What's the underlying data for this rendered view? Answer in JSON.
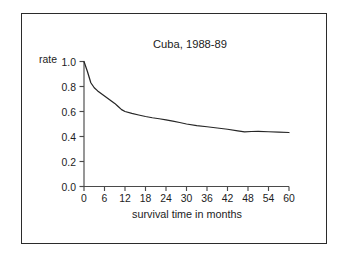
{
  "figure": {
    "background_color": "#ffffff",
    "frame_color": "#2b2b2b",
    "axis_color": "#4a4a4a",
    "curve_color": "#262626"
  },
  "chart_data": {
    "type": "line",
    "title": "Cuba, 1988-89",
    "xlabel": "survival time in months",
    "ylabel": "rate",
    "ylabel_position": "above-axis-left",
    "grid": false,
    "legend": false,
    "xlim": [
      0,
      60
    ],
    "ylim": [
      0.0,
      1.0
    ],
    "xticks": [
      0,
      6,
      12,
      18,
      24,
      30,
      36,
      42,
      48,
      54,
      60
    ],
    "xtick_labels": [
      "0",
      "6",
      "12",
      "18",
      "24",
      "30",
      "36",
      "42",
      "48",
      "54",
      "60"
    ],
    "yticks": [
      0.0,
      0.2,
      0.4,
      0.6,
      0.8,
      1.0
    ],
    "ytick_labels": [
      "0.0",
      "0.2",
      "0.4",
      "0.6",
      "0.8",
      "1.0"
    ],
    "series": [
      {
        "name": "survival rate",
        "x": [
          0,
          1,
          2,
          3,
          4,
          5,
          6,
          7,
          8,
          9,
          10,
          11,
          12,
          14,
          16,
          18,
          20,
          22,
          24,
          26,
          28,
          30,
          33,
          36,
          39,
          42,
          45,
          47,
          49,
          51,
          54,
          57,
          60
        ],
        "y": [
          1.0,
          0.92,
          0.83,
          0.79,
          0.765,
          0.745,
          0.725,
          0.705,
          0.685,
          0.665,
          0.64,
          0.615,
          0.6,
          0.585,
          0.572,
          0.56,
          0.55,
          0.542,
          0.533,
          0.523,
          0.512,
          0.5,
          0.487,
          0.478,
          0.468,
          0.458,
          0.445,
          0.437,
          0.44,
          0.441,
          0.438,
          0.435,
          0.432
        ]
      }
    ]
  }
}
